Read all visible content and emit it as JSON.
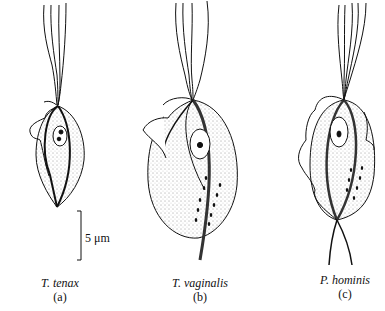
{
  "figure": {
    "organisms": [
      {
        "name": "T. tenax",
        "letter": "(a)"
      },
      {
        "name": "T. vaginalis",
        "letter": "(b)"
      },
      {
        "name": "P. hominis",
        "letter": "(c)"
      }
    ],
    "scale_bar": {
      "label": "5 μm"
    }
  }
}
